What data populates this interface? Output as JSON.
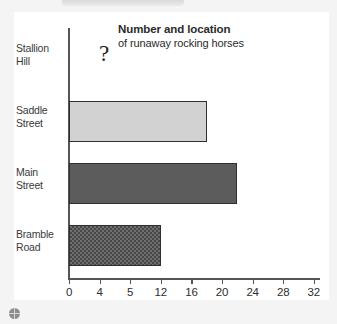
{
  "chart_data": {
    "type": "bar",
    "orientation": "horizontal",
    "title": "Number and location",
    "subtitle": "of runaway rocking horses",
    "xlabel": "",
    "ylabel": "",
    "categories": [
      "Stallion Hill",
      "Saddle Street",
      "Main Street",
      "Bramble Road"
    ],
    "values": [
      null,
      18,
      22,
      12
    ],
    "value_labels": [
      "?",
      "18",
      "22",
      "12"
    ],
    "unknown_marker": "?",
    "xlim": [
      0,
      32
    ],
    "xticks": [
      0,
      4,
      5,
      12,
      16,
      20,
      24,
      28,
      32
    ],
    "xtick_labels": [
      "0",
      "4",
      "5",
      "12",
      "16",
      "20",
      "24",
      "28",
      "32"
    ],
    "grid": false,
    "legend": false,
    "series": [
      {
        "name": "runaway rocking horses",
        "values": [
          null,
          18,
          22,
          12
        ]
      }
    ],
    "bar_styles": [
      "none",
      "solid-light-gray",
      "solid-dark-gray",
      "crosshatch-gray"
    ],
    "colors": {
      "bar_light": "#d2d2d2",
      "bar_dark": "#5c5c5c",
      "bar_hatch": "#6f6f6f",
      "bar_outline": "#2f2f2f",
      "axis": "#555555",
      "text": "#2b2b2b",
      "card_background": "#ffffff",
      "page_background": "#f4f4f4"
    }
  },
  "categories": [
    {
      "line1": "Stallion",
      "line2": "Hill"
    },
    {
      "line1": "Saddle",
      "line2": "Street"
    },
    {
      "line1": "Main",
      "line2": "Street"
    },
    {
      "line1": "Bramble",
      "line2": "Road"
    }
  ],
  "icons": {
    "page_marker": "globe-icon"
  }
}
